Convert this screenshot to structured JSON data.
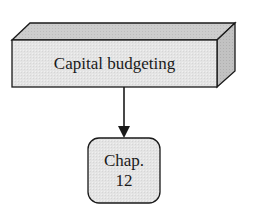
{
  "diagram": {
    "top_node": {
      "label": "Capital budgeting",
      "shape": "3d-box"
    },
    "bottom_node": {
      "line1": "Chap.",
      "line2": "12",
      "shape": "rounded-rectangle"
    },
    "edge": {
      "from": "Capital budgeting",
      "to": "Chap. 12",
      "type": "arrow"
    },
    "colors": {
      "front_face": "#e6e6e6",
      "top_face": "#cfcfcf",
      "side_face": "#bdbdbd",
      "chapter_fill": "#ececec",
      "stroke": "#1a1a1a"
    }
  }
}
